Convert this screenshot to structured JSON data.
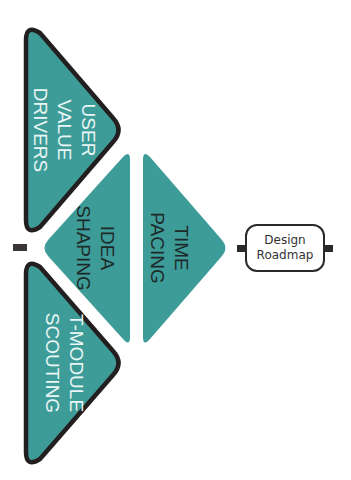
{
  "colors": {
    "teal": "#3d9c98",
    "outline": "#231f20",
    "background": "#ffffff"
  },
  "shapes": {
    "user_value_drivers": {
      "lines": [
        "USER",
        "VALUE",
        "DRIVERS"
      ],
      "text": "USER\nVALUE\nDRIVERS",
      "style": "outlined"
    },
    "t_module_scouting": {
      "lines": [
        "T-MODULE",
        "SCOUTING"
      ],
      "text": "T-MODULE\nSCOUTING",
      "style": "outlined"
    },
    "idea_shaping": {
      "lines": [
        "IDEA",
        "SHAPING"
      ],
      "text": "IDEA\nSHAPING",
      "style": "filled"
    },
    "time_pacing": {
      "lines": [
        "TIME",
        "PACING"
      ],
      "text": "TIME\nPACING",
      "style": "filled"
    }
  },
  "output_box": {
    "line1": "Design",
    "line2": "Roadmap"
  }
}
